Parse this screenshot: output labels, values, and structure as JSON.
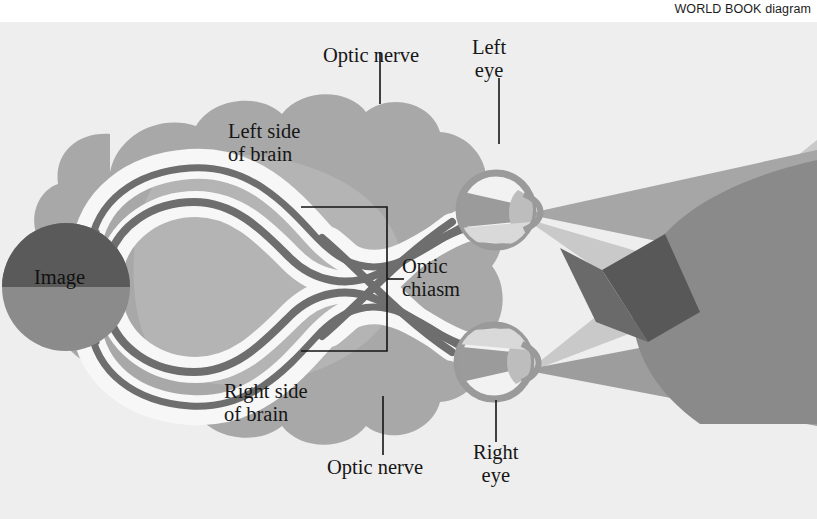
{
  "credit": {
    "text": "WORLD BOOK diagram"
  },
  "figure": {
    "background_color": "#eeeeee",
    "labels": {
      "optic_nerve_top": "Optic nerve",
      "optic_nerve_bottom": "Optic nerve",
      "left_eye": "Left\neye",
      "right_eye": "Right\neye",
      "left_side_of_brain": "Left side\nof brain",
      "right_side_of_brain": "Right side\nof brain",
      "optic_chiasm": "Optic\nchiasm",
      "image": "Image"
    },
    "colors": {
      "background": "#eeeeee",
      "brain_outer": "#a8a8a8",
      "brain_inner": "#b4b4b4",
      "pathway_white": "#f7f7f7",
      "nerve_dark": "#6e6e6e",
      "image_dark": "#5a5a5a",
      "image_mid": "#8b8b8b",
      "eye_ring": "#9a9a9a",
      "eye_white": "#f2f2f2",
      "cone_light": "#c9c9c9",
      "cone_mid": "#9d9d9d",
      "cone_dark": "#7b7b7b",
      "cone_darkest": "#5c5c5c",
      "leader_line": "#141414",
      "text": "#161616"
    },
    "parts": [
      {
        "name": "image-object",
        "label": "Image",
        "role": "visual stimulus projected onto both retinas"
      },
      {
        "name": "left-eye",
        "label": "Left eye",
        "role": "receives light from visual field"
      },
      {
        "name": "right-eye",
        "label": "Right eye",
        "role": "receives light from visual field"
      },
      {
        "name": "optic-nerve-left",
        "label": "Optic nerve",
        "role": "carries signals from left eye"
      },
      {
        "name": "optic-nerve-right",
        "label": "Optic nerve",
        "role": "carries signals from right eye"
      },
      {
        "name": "optic-chiasm",
        "label": "Optic chiasm",
        "role": "nerve fibers cross over"
      },
      {
        "name": "left-brain",
        "label": "Left side of brain",
        "role": "processes right visual field"
      },
      {
        "name": "right-brain",
        "label": "Right side of brain",
        "role": "processes left visual field"
      }
    ],
    "label_positions": {
      "optic_nerve_top": {
        "x": 323,
        "y": 24,
        "leader_x": 380,
        "leader_y0": 52,
        "leader_y1": 103
      },
      "optic_nerve_bottom": {
        "x": 327,
        "y": 459,
        "leader_x": 383,
        "leader_y0": 396,
        "leader_y1": 455
      },
      "left_eye": {
        "x": 472,
        "y": 22,
        "leader_x": 499,
        "leader_y0": 76,
        "leader_y1": 143
      },
      "right_eye": {
        "x": 473,
        "y": 424,
        "leader_x": 496,
        "leader_y0": 372,
        "leader_y1": 420
      },
      "left_side_of_brain": {
        "x": 232,
        "y": 110
      },
      "right_side_of_brain": {
        "x": 228,
        "y": 370
      },
      "optic_chiasm": {
        "x": 400,
        "y": 248
      },
      "image": {
        "x": 36,
        "y": 253
      }
    }
  }
}
